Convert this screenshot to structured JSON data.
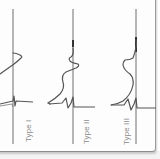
{
  "figure": {
    "panels": [
      {
        "id": "type-1",
        "label": "Type I"
      },
      {
        "id": "type-2",
        "label": "Type II"
      },
      {
        "id": "type-3",
        "label": "Type III"
      }
    ],
    "colors": {
      "axis": "#6e6e6e",
      "waveform": "#555555",
      "label": "#8a8a8a",
      "background": "#fdfdfd"
    }
  }
}
